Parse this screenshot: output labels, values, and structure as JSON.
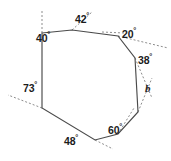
{
  "figure": {
    "shape": "octagon",
    "stroke_color": "#4a4a4a",
    "dashed_color": "#8d8d8d",
    "background": "#ffffff",
    "vertices": [
      {
        "id": "v1",
        "x": 42,
        "y": 33
      },
      {
        "id": "v2",
        "x": 72,
        "y": 30
      },
      {
        "id": "v3",
        "x": 118,
        "y": 36
      },
      {
        "id": "v4",
        "x": 135,
        "y": 58
      },
      {
        "id": "v5",
        "x": 138,
        "y": 112
      },
      {
        "id": "v6",
        "x": 118,
        "y": 134
      },
      {
        "id": "v7",
        "x": 95,
        "y": 140
      },
      {
        "id": "v8",
        "x": 42,
        "y": 108
      }
    ],
    "labels": [
      {
        "id": "a40",
        "name": "angle-40",
        "value": "40",
        "unit": "°",
        "x": 36,
        "y": 36,
        "vertex": "v1"
      },
      {
        "id": "a42",
        "name": "angle-42",
        "value": "42",
        "unit": "°",
        "x": 84,
        "y": 14,
        "vertex": "v2"
      },
      {
        "id": "a20",
        "name": "angle-20",
        "value": "20",
        "unit": "°",
        "x": 127,
        "y": 30,
        "vertex": "v3"
      },
      {
        "id": "a38",
        "name": "angle-38",
        "value": "38",
        "unit": "°",
        "x": 142,
        "y": 53,
        "vertex": "v4"
      },
      {
        "id": "a60",
        "name": "angle-60",
        "value": "60",
        "unit": "°",
        "x": 113,
        "y": 125,
        "vertex": "v6"
      },
      {
        "id": "a48",
        "name": "angle-48",
        "value": "48",
        "unit": "°",
        "x": 67,
        "y": 134,
        "vertex": "v7"
      },
      {
        "id": "a73",
        "name": "angle-73",
        "value": "73",
        "unit": "°",
        "x": 24,
        "y": 85,
        "vertex": "v8"
      }
    ],
    "unknown": {
      "id": "b",
      "name": "angle-b",
      "symbol": "b",
      "x": 147,
      "y": 85,
      "vertex": "v5"
    },
    "extension_rays": [
      {
        "id": "r40",
        "name": "extension-ray-40",
        "x1": 42,
        "y1": 33,
        "x2": 42,
        "y2": 11
      },
      {
        "id": "r42",
        "name": "extension-ray-42",
        "x1": 72,
        "y1": 30,
        "x2": 92,
        "y2": 12
      },
      {
        "id": "r42b",
        "name": "extension-ray-42-horizontal",
        "x1": 72,
        "y1": 30,
        "x2": 122,
        "y2": 32
      },
      {
        "id": "r20",
        "name": "extension-ray-20",
        "x1": 118,
        "y1": 36,
        "x2": 168,
        "y2": 48
      },
      {
        "id": "r38",
        "name": "extension-ray-38",
        "x1": 135,
        "y1": 58,
        "x2": 152,
        "y2": 98
      },
      {
        "id": "rb",
        "name": "extension-ray-b",
        "x1": 138,
        "y1": 112,
        "x2": 152,
        "y2": 78
      },
      {
        "id": "r60",
        "name": "extension-ray-60",
        "x1": 118,
        "y1": 134,
        "x2": 134,
        "y2": 108
      },
      {
        "id": "r48",
        "name": "extension-ray-48",
        "x1": 95,
        "y1": 140,
        "x2": 112,
        "y2": 148
      },
      {
        "id": "r73",
        "name": "extension-ray-73",
        "x1": 42,
        "y1": 108,
        "x2": 8,
        "y2": 95
      }
    ]
  }
}
